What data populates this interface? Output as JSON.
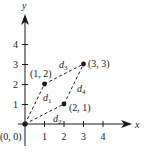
{
  "diagram": {
    "type": "coordinate-plane",
    "axes": {
      "x_label": "x",
      "y_label": "y",
      "x_ticks": [
        "1",
        "2",
        "3",
        "4"
      ],
      "y_ticks": [
        "1",
        "2",
        "3",
        "4"
      ]
    },
    "points": [
      {
        "id": "p0",
        "label": "(0, 0)",
        "x": 0,
        "y": 0
      },
      {
        "id": "p1",
        "label": "(1, 2)",
        "x": 1,
        "y": 2
      },
      {
        "id": "p2",
        "label": "(2, 1)",
        "x": 2,
        "y": 1
      },
      {
        "id": "p3",
        "label": "(3, 3)",
        "x": 3,
        "y": 3
      }
    ],
    "segments": [
      {
        "label": "d",
        "subscript": "1",
        "from": "p0",
        "to": "p1",
        "style": "dashed"
      },
      {
        "label": "d",
        "subscript": "2",
        "from": "p0",
        "to": "p2",
        "style": "dashed"
      },
      {
        "label": "d",
        "subscript": "3",
        "from": "p1",
        "to": "p3",
        "style": "dashed"
      },
      {
        "label": "d",
        "subscript": "4",
        "from": "p2",
        "to": "p3",
        "style": "dashed"
      }
    ],
    "colors": {
      "ink": "#1a1a1a",
      "background": "#ffffff"
    }
  }
}
